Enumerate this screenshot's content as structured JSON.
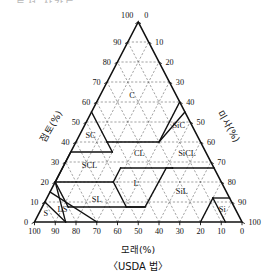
{
  "figure": {
    "top_cut_text": "· 토성 삼각도",
    "bottom_axis_title": "모래(%)",
    "left_axis_title": "점토(%)",
    "right_axis_title": "미사(%)",
    "caption": "〈USDA 법〉"
  },
  "chart_data": {
    "type": "diagram",
    "subtype": "ternary-soil-texture-triangle",
    "title": "〈USDA 법〉",
    "axes": [
      {
        "name": "bottom",
        "label": "모래(%)",
        "component": "sand",
        "ticks": [
          100,
          90,
          80,
          70,
          60,
          50,
          40,
          30,
          20,
          10,
          0
        ],
        "direction": "right-to-left"
      },
      {
        "name": "left",
        "label": "점토(%)",
        "component": "clay",
        "ticks": [
          100,
          90,
          80,
          70,
          60,
          50,
          40,
          30,
          20,
          10,
          0
        ],
        "direction": "top-to-bottom"
      },
      {
        "name": "right",
        "label": "미사(%)",
        "component": "silt",
        "ticks": [
          0,
          10,
          20,
          30,
          40,
          50,
          60,
          70,
          80,
          90,
          100
        ],
        "direction": "top-to-bottom"
      }
    ],
    "grid": "dashed lines parallel to all three edges at every 10%",
    "legend": "none",
    "classes": [
      {
        "code": "C",
        "name": "Clay",
        "label_clay": 62,
        "label_sand": 22
      },
      {
        "code": "SiC",
        "name": "Silty Clay",
        "label_clay": 47,
        "label_sand": 7
      },
      {
        "code": "SC",
        "name": "Sandy Clay",
        "label_clay": 42,
        "label_sand": 52
      },
      {
        "code": "CL",
        "name": "Clay Loam",
        "label_clay": 33,
        "label_sand": 33
      },
      {
        "code": "SiCL",
        "name": "Silty Clay Loam",
        "label_clay": 33,
        "label_sand": 10
      },
      {
        "code": "SCL",
        "name": "Sandy Clay Loam",
        "label_clay": 27,
        "label_sand": 60
      },
      {
        "code": "L",
        "name": "Loam",
        "label_clay": 18,
        "label_sand": 42
      },
      {
        "code": "SiL",
        "name": "Silt Loam",
        "label_clay": 14,
        "label_sand": 22
      },
      {
        "code": "Si",
        "name": "Silt",
        "label_clay": 5,
        "label_sand": 7
      },
      {
        "code": "SL",
        "name": "Sandy Loam",
        "label_clay": 10,
        "label_sand": 65
      },
      {
        "code": "LS",
        "name": "Loamy Sand",
        "label_clay": 5,
        "label_sand": 84
      },
      {
        "code": "S",
        "name": "Sand",
        "label_clay": 3,
        "label_sand": 93
      }
    ],
    "class_labels": {
      "clay": "C",
      "silty_clay": "SiC",
      "sandy_clay": "SC",
      "clay_loam": "CL",
      "silty_clay_loam": "SiCL",
      "sandy_clay_loam": "SCL",
      "loam": "L",
      "silt_loam": "SiL",
      "silt": "Si",
      "sandy_loam": "SL",
      "loamy_sand": "LS",
      "sand": "S"
    },
    "apex_labels": {
      "top_left": "100",
      "top_right": "0",
      "bottom_left": "0",
      "bottom_right": "100"
    }
  }
}
